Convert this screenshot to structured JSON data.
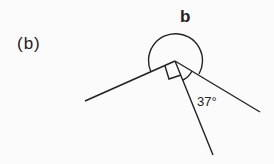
{
  "part_label": "(b)",
  "angle_label_b": "b",
  "angle_label_37": "37°",
  "stroke_color": "#222222",
  "background": "#fbfbfb",
  "geometry": {
    "vertex": [
      175,
      61
    ],
    "rays_end": [
      [
        85,
        101
      ],
      [
        213,
        155
      ],
      [
        260,
        112
      ]
    ],
    "reflex_arc_label": "b",
    "right_angle_marker": true,
    "acute_angle_degrees": 37
  }
}
